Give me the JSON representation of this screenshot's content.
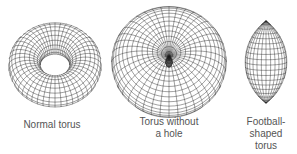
{
  "figure": {
    "shapes": [
      {
        "id": "normal-torus",
        "label_lines": [
          "Normal torus"
        ]
      },
      {
        "id": "torus-without-hole",
        "label_lines": [
          "Torus without",
          "a hole"
        ]
      },
      {
        "id": "football-torus",
        "label_lines": [
          "Football-",
          "shaped",
          "torus"
        ]
      }
    ],
    "colors": {
      "line": "#222222",
      "text": "#555555",
      "background": "#ffffff"
    }
  }
}
